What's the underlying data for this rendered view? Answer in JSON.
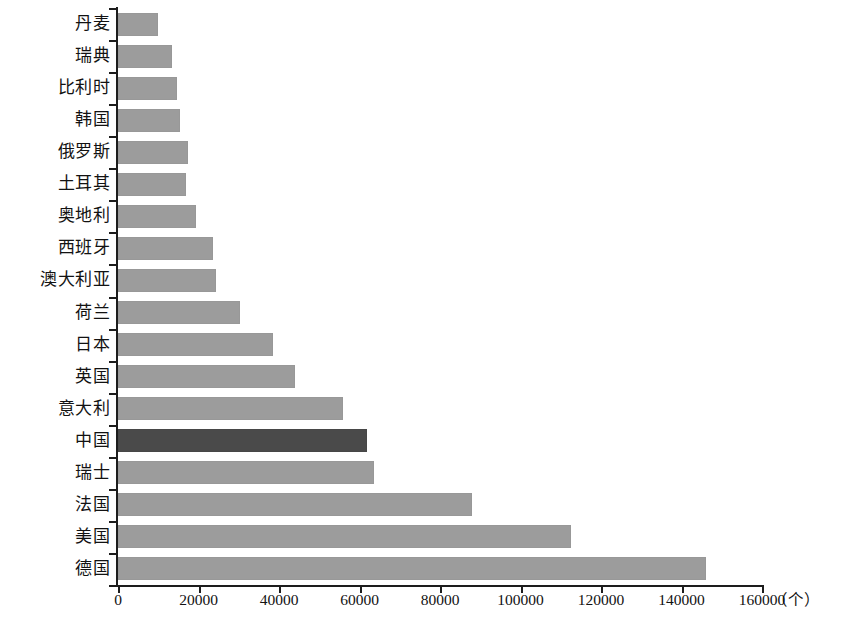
{
  "chart_data": {
    "type": "bar",
    "orientation": "horizontal",
    "title": "",
    "subtitle": "",
    "xlabel": "",
    "ylabel": "",
    "unit_label": "（个）",
    "xlim": [
      0,
      160000
    ],
    "xticks": [
      0,
      20000,
      40000,
      60000,
      80000,
      100000,
      120000,
      140000,
      160000
    ],
    "xtick_labels": [
      "0",
      "20000",
      "40000",
      "60000",
      "80000",
      "100000",
      "120000",
      "140000",
      "160000"
    ],
    "grid": false,
    "legend": null,
    "categories": [
      "丹麦",
      "瑞典",
      "比利时",
      "韩国",
      "俄罗斯",
      "土耳其",
      "奥地利",
      "西班牙",
      "澳大利亚",
      "荷兰",
      "日本",
      "英国",
      "意大利",
      "中国",
      "瑞士",
      "法国",
      "美国",
      "德国"
    ],
    "values": [
      9900,
      13400,
      14700,
      15500,
      17300,
      17000,
      19500,
      23500,
      24400,
      30200,
      38400,
      44000,
      55900,
      61800,
      63700,
      88000,
      112500,
      146000
    ],
    "highlight_category": "中国",
    "colors": {
      "bar": "#9c9c9c",
      "bar_highlight": "#4a4a4a",
      "axis": "#1d1d1d",
      "text": "#121212",
      "background": "#ffffff"
    }
  }
}
